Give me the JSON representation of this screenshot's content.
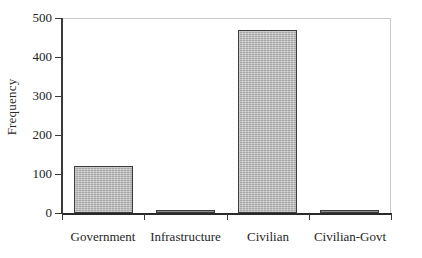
{
  "chart_data": {
    "type": "bar",
    "title": "",
    "subtitle": "",
    "xlabel": "",
    "ylabel": "Frequency",
    "categories": [
      "Government",
      "Infrastructure",
      "Civilian",
      "Civilian-Govt"
    ],
    "values": [
      120,
      8,
      468,
      3
    ],
    "ylim": [
      0,
      500
    ],
    "yticks": [
      0,
      100,
      200,
      300,
      400,
      500
    ],
    "ytick_labels": [
      "0",
      "100",
      "200",
      "300",
      "400",
      "500"
    ],
    "grid": false,
    "legend": false,
    "legend_position": "none",
    "series": [
      {
        "name": "Frequency",
        "values": [
          120,
          8,
          468,
          3
        ]
      }
    ],
    "annotations": []
  },
  "axes": {
    "y_title": "Frequency",
    "y_ticks": [
      {
        "label": "500",
        "value": 500
      },
      {
        "label": "400",
        "value": 400
      },
      {
        "label": "300",
        "value": 300
      },
      {
        "label": "200",
        "value": 200
      },
      {
        "label": "100",
        "value": 100
      },
      {
        "label": "0",
        "value": 0
      }
    ],
    "x_categories": [
      {
        "label": "Government"
      },
      {
        "label": "Infrastructure"
      },
      {
        "label": "Civilian"
      },
      {
        "label": "Civilian-Govt"
      }
    ]
  },
  "style": {
    "bar_fill": "#b6b6b6",
    "bar_border": "#3c3c3c",
    "axis_color": "#2a2a2a",
    "frame_color": "#c9c9c9",
    "text_color": "#1f1f1f",
    "background": "#ffffff"
  }
}
